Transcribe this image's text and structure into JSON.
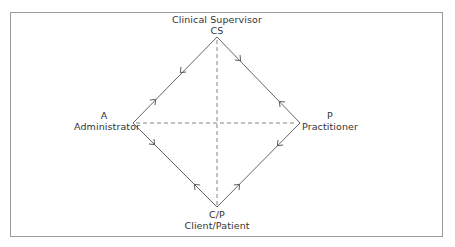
{
  "diagram": {
    "type": "relationship-diamond",
    "nodes": {
      "top": {
        "title": "Clinical Supervisor",
        "code": "CS"
      },
      "left": {
        "code": "A",
        "title": "Administrator"
      },
      "right": {
        "code": "P",
        "title": "Practitioner"
      },
      "bottom": {
        "code": "C/P",
        "title": "Client/Patient"
      }
    },
    "edges": [
      {
        "from": "CS",
        "to": "A",
        "style": "solid",
        "arrows": "bidirectional"
      },
      {
        "from": "CS",
        "to": "P",
        "style": "solid",
        "arrows": "bidirectional"
      },
      {
        "from": "A",
        "to": "C/P",
        "style": "solid",
        "arrows": "bidirectional"
      },
      {
        "from": "P",
        "to": "C/P",
        "style": "solid",
        "arrows": "bidirectional"
      },
      {
        "from": "CS",
        "to": "C/P",
        "style": "dashed",
        "arrows": "none"
      },
      {
        "from": "A",
        "to": "P",
        "style": "dashed",
        "arrows": "none"
      }
    ],
    "colors": {
      "line": "#555555",
      "border": "#9a9a9a",
      "text": "#333333"
    }
  }
}
